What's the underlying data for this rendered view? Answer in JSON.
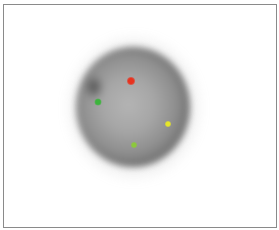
{
  "image": {
    "description": "Fluorescence microscopy image of a single cell nucleus (grayscale) with colored FISH signal dots",
    "background_color": "#ffffff",
    "frame_border_color": "#8a8a8a"
  },
  "nucleus": {
    "center": [
      130,
      107
    ],
    "width": 114,
    "height": 120,
    "core_color": "#b4b4b4",
    "rim_color": "#565656"
  },
  "signals": [
    {
      "name": "red-signal",
      "color": "#e8321e",
      "x": 131,
      "y": 81,
      "size": 8
    },
    {
      "name": "green-signal",
      "color": "#3cb43c",
      "x": 98,
      "y": 102,
      "size": 7
    },
    {
      "name": "yellow-signal",
      "color": "#e6e628",
      "x": 168,
      "y": 124,
      "size": 6
    },
    {
      "name": "yellowgreen-signal",
      "color": "#8cc83c",
      "x": 134,
      "y": 145,
      "size": 6
    }
  ]
}
